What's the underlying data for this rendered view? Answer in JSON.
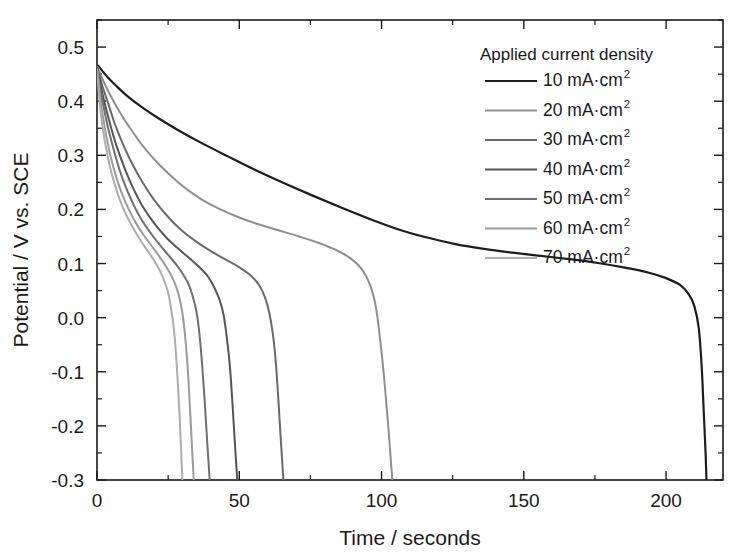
{
  "chart_data": {
    "type": "line",
    "title": "",
    "xlabel": "Time / seconds",
    "ylabel": "Potential / V vs. SCE",
    "xlim": [
      0,
      220
    ],
    "ylim": [
      -0.3,
      0.55
    ],
    "grid": false,
    "legend_position": "top-right",
    "legend_title": "Applied current density",
    "x_ticks": [
      0,
      50,
      100,
      150,
      200
    ],
    "x_tick_labels": [
      "0",
      "50",
      "100",
      "150",
      "200"
    ],
    "x_minor_step": 25,
    "y_ticks": [
      -0.3,
      -0.2,
      -0.1,
      0.0,
      0.1,
      0.2,
      0.3,
      0.4,
      0.5
    ],
    "y_tick_labels": [
      "-0.3",
      "-0.2",
      "-0.1",
      "0.0",
      "0.1",
      "0.2",
      "0.3",
      "0.4",
      "0.5"
    ],
    "y_minor_step": 0.05,
    "series": [
      {
        "name": "10 mA·cm",
        "exponent": "2",
        "color": "#1d1d1d",
        "width": 2.2,
        "points": [
          [
            0,
            0.467
          ],
          [
            1,
            0.462
          ],
          [
            2,
            0.455
          ],
          [
            4,
            0.443
          ],
          [
            7,
            0.427
          ],
          [
            11,
            0.408
          ],
          [
            16,
            0.388
          ],
          [
            22,
            0.367
          ],
          [
            29,
            0.345
          ],
          [
            37,
            0.322
          ],
          [
            46,
            0.298
          ],
          [
            56,
            0.272
          ],
          [
            66,
            0.248
          ],
          [
            76,
            0.225
          ],
          [
            86,
            0.203
          ],
          [
            96,
            0.182
          ],
          [
            106,
            0.163
          ],
          [
            116,
            0.148
          ],
          [
            126,
            0.136
          ],
          [
            136,
            0.127
          ],
          [
            146,
            0.12
          ],
          [
            156,
            0.114
          ],
          [
            166,
            0.108
          ],
          [
            176,
            0.101
          ],
          [
            186,
            0.092
          ],
          [
            194,
            0.083
          ],
          [
            200,
            0.073
          ],
          [
            205,
            0.06
          ],
          [
            208,
            0.043
          ],
          [
            210,
            0.02
          ],
          [
            211.5,
            -0.02
          ],
          [
            212.5,
            -0.09
          ],
          [
            213.2,
            -0.17
          ],
          [
            213.8,
            -0.24
          ],
          [
            214.2,
            -0.3
          ]
        ]
      },
      {
        "name": "20 mA·cm",
        "exponent": "2",
        "color": "#8f8f8f",
        "width": 2.0,
        "points": [
          [
            0,
            0.465
          ],
          [
            1,
            0.452
          ],
          [
            2,
            0.44
          ],
          [
            4,
            0.418
          ],
          [
            7,
            0.389
          ],
          [
            11,
            0.355
          ],
          [
            16,
            0.318
          ],
          [
            22,
            0.282
          ],
          [
            29,
            0.248
          ],
          [
            36,
            0.221
          ],
          [
            43,
            0.201
          ],
          [
            50,
            0.185
          ],
          [
            57,
            0.172
          ],
          [
            64,
            0.161
          ],
          [
            71,
            0.15
          ],
          [
            78,
            0.138
          ],
          [
            84,
            0.125
          ],
          [
            89,
            0.11
          ],
          [
            93,
            0.09
          ],
          [
            96,
            0.06
          ],
          [
            98,
            0.02
          ],
          [
            99.5,
            -0.04
          ],
          [
            100.7,
            -0.1
          ],
          [
            101.7,
            -0.16
          ],
          [
            102.5,
            -0.21
          ],
          [
            103.2,
            -0.26
          ],
          [
            103.8,
            -0.3
          ]
        ]
      },
      {
        "name": "30 mA·cm",
        "exponent": "2",
        "color": "#6a6a6a",
        "width": 2.0,
        "points": [
          [
            0,
            0.463
          ],
          [
            1,
            0.444
          ],
          [
            2,
            0.426
          ],
          [
            4,
            0.395
          ],
          [
            6,
            0.362
          ],
          [
            9,
            0.322
          ],
          [
            12,
            0.288
          ],
          [
            16,
            0.25
          ],
          [
            20,
            0.218
          ],
          [
            25,
            0.186
          ],
          [
            30,
            0.16
          ],
          [
            35,
            0.14
          ],
          [
            40,
            0.123
          ],
          [
            45,
            0.108
          ],
          [
            50,
            0.093
          ],
          [
            54,
            0.078
          ],
          [
            57,
            0.06
          ],
          [
            59,
            0.038
          ],
          [
            60.5,
            0.01
          ],
          [
            61.8,
            -0.03
          ],
          [
            62.8,
            -0.08
          ],
          [
            63.6,
            -0.14
          ],
          [
            64.3,
            -0.2
          ],
          [
            64.9,
            -0.25
          ],
          [
            65.5,
            -0.3
          ]
        ]
      },
      {
        "name": "40 mA·cm",
        "exponent": "2",
        "color": "#555555",
        "width": 2.0,
        "points": [
          [
            0,
            0.462
          ],
          [
            1,
            0.436
          ],
          [
            2,
            0.412
          ],
          [
            3,
            0.39
          ],
          [
            5,
            0.35
          ],
          [
            7,
            0.315
          ],
          [
            10,
            0.272
          ],
          [
            13,
            0.236
          ],
          [
            16,
            0.206
          ],
          [
            20,
            0.175
          ],
          [
            24,
            0.15
          ],
          [
            28,
            0.13
          ],
          [
            32,
            0.112
          ],
          [
            36,
            0.093
          ],
          [
            39,
            0.076
          ],
          [
            41,
            0.058
          ],
          [
            43,
            0.034
          ],
          [
            44.5,
            0.005
          ],
          [
            45.7,
            -0.04
          ],
          [
            46.7,
            -0.09
          ],
          [
            47.5,
            -0.15
          ],
          [
            48.2,
            -0.21
          ],
          [
            48.8,
            -0.26
          ],
          [
            49.3,
            -0.3
          ]
        ]
      },
      {
        "name": "50 mA·cm",
        "exponent": "2",
        "color": "#6f6f6f",
        "width": 2.0,
        "points": [
          [
            0,
            0.461
          ],
          [
            1,
            0.428
          ],
          [
            2,
            0.398
          ],
          [
            3,
            0.372
          ],
          [
            4,
            0.348
          ],
          [
            6,
            0.308
          ],
          [
            8,
            0.272
          ],
          [
            10,
            0.243
          ],
          [
            13,
            0.207
          ],
          [
            16,
            0.178
          ],
          [
            19,
            0.155
          ],
          [
            22,
            0.135
          ],
          [
            25,
            0.116
          ],
          [
            28,
            0.097
          ],
          [
            30,
            0.082
          ],
          [
            32,
            0.064
          ],
          [
            33.5,
            0.042
          ],
          [
            35,
            0.01
          ],
          [
            36,
            -0.03
          ],
          [
            37,
            -0.09
          ],
          [
            37.8,
            -0.15
          ],
          [
            38.5,
            -0.21
          ],
          [
            39.1,
            -0.26
          ],
          [
            39.6,
            -0.3
          ]
        ]
      },
      {
        "name": "60 mA·cm",
        "exponent": "2",
        "color": "#9b9b9b",
        "width": 2.0,
        "points": [
          [
            0,
            0.46
          ],
          [
            0.8,
            0.42
          ],
          [
            1.6,
            0.388
          ],
          [
            2.5,
            0.358
          ],
          [
            3.5,
            0.33
          ],
          [
            5,
            0.293
          ],
          [
            7,
            0.256
          ],
          [
            9,
            0.226
          ],
          [
            11,
            0.202
          ],
          [
            14,
            0.172
          ],
          [
            17,
            0.148
          ],
          [
            20,
            0.127
          ],
          [
            23,
            0.105
          ],
          [
            25,
            0.088
          ],
          [
            27,
            0.068
          ],
          [
            28.5,
            0.046
          ],
          [
            29.8,
            0.015
          ],
          [
            30.8,
            -0.025
          ],
          [
            31.7,
            -0.08
          ],
          [
            32.4,
            -0.14
          ],
          [
            33.0,
            -0.2
          ],
          [
            33.6,
            -0.26
          ],
          [
            34.0,
            -0.3
          ]
        ]
      },
      {
        "name": "70 mA·cm",
        "exponent": "2",
        "color": "#adadad",
        "width": 2.0,
        "points": [
          [
            0,
            0.458
          ],
          [
            0.7,
            0.412
          ],
          [
            1.4,
            0.375
          ],
          [
            2.2,
            0.344
          ],
          [
            3.2,
            0.313
          ],
          [
            4.5,
            0.28
          ],
          [
            6,
            0.25
          ],
          [
            8,
            0.218
          ],
          [
            10,
            0.193
          ],
          [
            12,
            0.172
          ],
          [
            15,
            0.145
          ],
          [
            18,
            0.122
          ],
          [
            20,
            0.106
          ],
          [
            22,
            0.088
          ],
          [
            23.5,
            0.07
          ],
          [
            25,
            0.046
          ],
          [
            26,
            0.018
          ],
          [
            27,
            -0.02
          ],
          [
            27.8,
            -0.07
          ],
          [
            28.5,
            -0.13
          ],
          [
            29.1,
            -0.19
          ],
          [
            29.6,
            -0.25
          ],
          [
            30.0,
            -0.3
          ]
        ]
      }
    ]
  },
  "legend": {
    "title": "Applied current density",
    "items": [
      {
        "label": "10 mA·cm",
        "sup": "2"
      },
      {
        "label": "20 mA·cm",
        "sup": "2"
      },
      {
        "label": "30 mA·cm",
        "sup": "2"
      },
      {
        "label": "40 mA·cm",
        "sup": "2"
      },
      {
        "label": "50 mA·cm",
        "sup": "2"
      },
      {
        "label": "60 mA·cm",
        "sup": "2"
      },
      {
        "label": "70 mA·cm",
        "sup": "2"
      }
    ]
  },
  "axes": {
    "x_title": "Time / seconds",
    "y_title": "Potential / V vs. SCE"
  }
}
